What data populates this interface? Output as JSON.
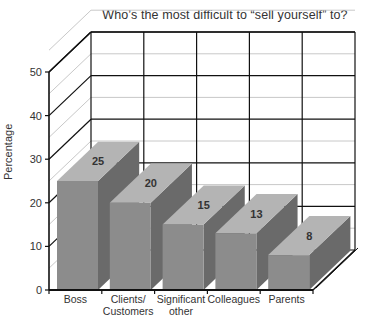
{
  "chart_data": {
    "type": "bar",
    "style": "3d",
    "title": "Who’s the most difficult to “sell yourself” to?",
    "xlabel": "",
    "ylabel": "Percentage",
    "ylim": [
      0,
      50
    ],
    "yticks": [
      0,
      10,
      20,
      30,
      40,
      50
    ],
    "grid": true,
    "legend": null,
    "categories": [
      "Boss",
      "Clients/ Customers",
      "Significant other",
      "Colleagues",
      "Parents"
    ],
    "category_lines": [
      [
        "Boss"
      ],
      [
        "Clients/",
        "Customers"
      ],
      [
        "Significant",
        "other"
      ],
      [
        "Colleagues"
      ],
      [
        "Parents"
      ]
    ],
    "values": [
      25,
      20,
      15,
      13,
      8
    ],
    "colors": {
      "front": "#8c8c8c",
      "top": "#b4b4b4",
      "side": "#6a6a6a",
      "axis": "#111111",
      "minor_grid": "#c8c8c8"
    }
  }
}
